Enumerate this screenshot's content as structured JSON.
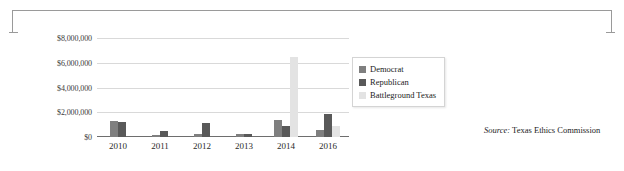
{
  "figure": {
    "bracket_color": "#9a9a9a"
  },
  "source_note": {
    "label": "Source:",
    "text": "Texas Ethics Commission"
  },
  "legend": {
    "position": "right-inside",
    "entries": [
      {
        "name": "Democrat",
        "color": "#7f7f7f"
      },
      {
        "name": "Republican",
        "color": "#595959"
      },
      {
        "name": "Battleground Texas",
        "color": "#e3e3e3"
      }
    ]
  },
  "chart_data": {
    "type": "bar",
    "title": "",
    "subtitle": "",
    "xlabel": "",
    "ylabel": "",
    "grid": true,
    "legend_position": "right-inside",
    "categories": [
      "2010",
      "2011",
      "2012",
      "2013",
      "2014",
      "2016"
    ],
    "ylim": [
      0,
      8000000
    ],
    "yticks": [
      0,
      2000000,
      4000000,
      6000000,
      8000000
    ],
    "ytick_labels": [
      "$0",
      "$2,000,000",
      "$4,000,000",
      "$6,000,000",
      "$8,000,000"
    ],
    "series": [
      {
        "name": "Democrat",
        "color": "#7f7f7f",
        "values": [
          1300000,
          150000,
          250000,
          230000,
          1400000,
          600000
        ]
      },
      {
        "name": "Republican",
        "color": "#595959",
        "values": [
          1200000,
          450000,
          1100000,
          230000,
          850000,
          1900000
        ]
      },
      {
        "name": "Battleground Texas",
        "color": "#e3e3e3",
        "values": [
          0,
          0,
          0,
          0,
          6500000,
          900000
        ]
      }
    ]
  }
}
